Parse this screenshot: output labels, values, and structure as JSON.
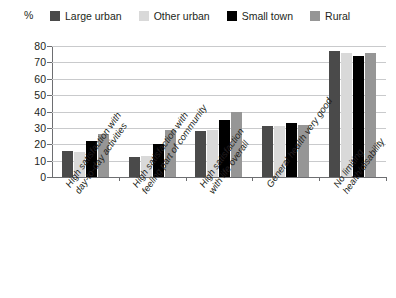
{
  "axis": {
    "y_unit_label": "%",
    "y_ticks": [
      "80",
      "70",
      "60",
      "50",
      "40",
      "30",
      "20",
      "10",
      "0"
    ]
  },
  "legend": {
    "items": [
      {
        "label": "Large urban",
        "color": "#4a4a4a",
        "swatch_name": "legend-swatch-large-urban"
      },
      {
        "label": "Other urban",
        "color": "#d9d9d9",
        "swatch_name": "legend-swatch-other-urban"
      },
      {
        "label": "Small town",
        "color": "#000000",
        "swatch_name": "legend-swatch-small-town"
      },
      {
        "label": "Rural",
        "color": "#969696",
        "swatch_name": "legend-swatch-rural"
      }
    ]
  },
  "categories": [
    {
      "line1": "High satisfaction with",
      "line2": "day-to-day activities"
    },
    {
      "line1": "High satisfaction with",
      "line2": "feeling part of community"
    },
    {
      "line1": "High satisfaction",
      "line2": "with life overall"
    },
    {
      "line1": "General health very good",
      "line2": ""
    },
    {
      "line1": "No limiting",
      "line2": "health/disability"
    }
  ],
  "chart_data": {
    "type": "bar",
    "title": "",
    "xlabel": "",
    "ylabel": "%",
    "ylim": [
      0,
      80
    ],
    "ytick_step": 10,
    "grid": true,
    "legend_position": "top",
    "categories": [
      "High satisfaction with day-to-day activities",
      "High satisfaction with feeling part of community",
      "High satisfaction with life overall",
      "General health very good",
      "No limiting health/disability"
    ],
    "series": [
      {
        "name": "Large urban",
        "color": "#4a4a4a",
        "values": [
          16,
          12,
          28,
          31,
          77
        ]
      },
      {
        "name": "Other urban",
        "color": "#d9d9d9",
        "values": [
          15,
          13,
          29,
          31,
          76
        ]
      },
      {
        "name": "Small town",
        "color": "#000000",
        "values": [
          22,
          20,
          35,
          33,
          74
        ]
      },
      {
        "name": "Rural",
        "color": "#969696",
        "values": [
          26,
          29,
          40,
          32,
          76
        ]
      }
    ]
  }
}
